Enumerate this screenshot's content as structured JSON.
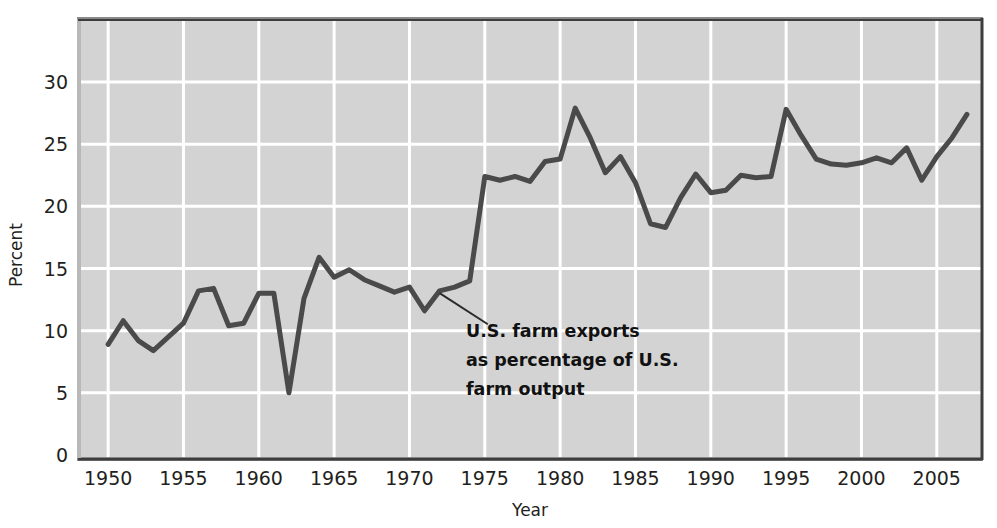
{
  "chart_data": {
    "type": "line",
    "title": "",
    "xlabel": "Year",
    "ylabel": "Percent",
    "xlim": [
      1948,
      2008
    ],
    "ylim": [
      0,
      34
    ],
    "grid": true,
    "legend": "none",
    "xticks": [
      1950,
      1955,
      1960,
      1965,
      1970,
      1975,
      1980,
      1985,
      1990,
      1995,
      2000,
      2005
    ],
    "xtick_labels": [
      "1950",
      "1955",
      "1960",
      "1965",
      "1970",
      "1975",
      "1980",
      "1985",
      "1990",
      "1995",
      "2000",
      "2005"
    ],
    "yticks": [
      0,
      5,
      10,
      15,
      20,
      25,
      30
    ],
    "ytick_labels": [
      "0",
      "5",
      "10",
      "15",
      "20",
      "25",
      "30"
    ],
    "series": [
      {
        "name": "U.S. farm exports as percentage of U.S. farm output",
        "color": "#4a4a4a",
        "x": [
          1950,
          1951,
          1952,
          1953,
          1954,
          1955,
          1956,
          1957,
          1958,
          1959,
          1960,
          1961,
          1962,
          1963,
          1964,
          1965,
          1966,
          1967,
          1968,
          1969,
          1970,
          1971,
          1972,
          1973,
          1974,
          1975,
          1976,
          1977,
          1978,
          1979,
          1980,
          1981,
          1982,
          1983,
          1984,
          1985,
          1986,
          1987,
          1988,
          1989,
          1990,
          1991,
          1992,
          1993,
          1994,
          1995,
          1996,
          1997,
          1998,
          1999,
          2000,
          2001,
          2002,
          2003,
          2004,
          2005,
          2006,
          2007
        ],
        "values": [
          8.9,
          10.8,
          9.2,
          8.4,
          9.5,
          10.6,
          13.2,
          13.4,
          10.4,
          10.6,
          13.0,
          13.0,
          5.0,
          12.6,
          15.9,
          14.3,
          14.9,
          14.1,
          13.6,
          13.1,
          13.5,
          11.6,
          13.2,
          13.5,
          14.0,
          22.4,
          22.1,
          22.4,
          22.0,
          23.6,
          23.8,
          27.9,
          25.5,
          22.7,
          24.0,
          21.9,
          18.6,
          18.3,
          20.7,
          22.6,
          21.1,
          21.3,
          22.5,
          22.3,
          22.4,
          27.8,
          25.7,
          23.8,
          23.4,
          23.3,
          23.5,
          23.9,
          23.5,
          24.7,
          22.1,
          24.0,
          25.5,
          27.4
        ]
      }
    ],
    "annotation": {
      "lines": [
        "U.S. farm exports",
        "as percentage of U.S.",
        "farm output"
      ],
      "leader_from": {
        "x": 1972,
        "y": 13.5
      },
      "leader_to": {
        "x": 1975.2,
        "y": 11.0
      }
    },
    "colors": {
      "plot_background": "#d3d3d3",
      "gridline": "#ffffff",
      "line": "#4a4a4a",
      "text": "#231f20",
      "border": "#6e6e6e"
    }
  }
}
